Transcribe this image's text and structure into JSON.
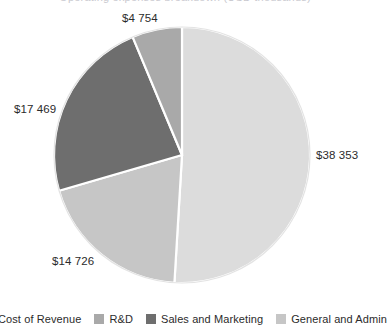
{
  "title_sliver": "Operating expenses breakdown (USD thousands)",
  "chart_data": {
    "type": "pie",
    "title": "",
    "xlabel": "",
    "ylabel": "",
    "legend_position": "bottom",
    "grid": false,
    "start_angle_deg": 0,
    "direction": "clockwise",
    "center": {
      "x": 182,
      "y": 155
    },
    "radius": 128,
    "total": 75302,
    "categories": [
      "Cost of Revenue",
      "R&D",
      "Sales and Marketing",
      "General and Admin"
    ],
    "values": [
      38353,
      4754,
      17469,
      14726
    ],
    "value_labels": [
      "$38 353",
      "$4 754",
      "$17 469",
      "$14 726"
    ],
    "percentages": [
      50.9,
      6.3,
      23.2,
      19.6
    ],
    "colors": [
      "#dcdcdc",
      "#a9a9a9",
      "#6e6e6e",
      "#c6c6c6"
    ],
    "slices": [
      {
        "name": "Cost of Revenue",
        "label": "$38 353",
        "value": 38353,
        "percent": 50.9,
        "color": "#dcdcdc",
        "start_deg": 0,
        "end_deg": 183.4
      },
      {
        "name": "General and Admin",
        "label": "$14 726",
        "value": 14726,
        "percent": 19.6,
        "color": "#c6c6c6",
        "start_deg": 183.4,
        "end_deg": 253.8
      },
      {
        "name": "Sales and Marketing",
        "label": "$17 469",
        "value": 17469,
        "percent": 23.2,
        "color": "#6e6e6e",
        "start_deg": 253.8,
        "end_deg": 337.3
      },
      {
        "name": "R&D",
        "label": "$4 754",
        "value": 4754,
        "percent": 6.3,
        "color": "#a9a9a9",
        "start_deg": 337.3,
        "end_deg": 360
      }
    ]
  },
  "labels": {
    "cost_of_revenue": "$38 353",
    "general_and_admin": "$14 726",
    "sales_and_marketing": "$17 469",
    "rnd": "$4 754"
  },
  "legend": {
    "items": [
      {
        "label": "Cost of Revenue",
        "color": "#dcdcdc"
      },
      {
        "label": "R&D",
        "color": "#a9a9a9"
      },
      {
        "label": "Sales and Marketing",
        "color": "#6e6e6e"
      },
      {
        "label": "General and Admin",
        "color": "#c6c6c6"
      }
    ]
  }
}
